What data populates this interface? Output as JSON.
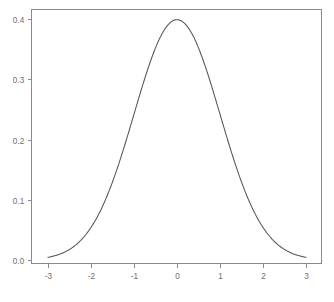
{
  "chart_data": {
    "type": "line",
    "title": "",
    "subtitle": "",
    "xlabel": "",
    "ylabel": "",
    "xlim": [
      -3,
      3
    ],
    "ylim": [
      0.0,
      0.42
    ],
    "grid": false,
    "legend": null,
    "legend_position": "none",
    "annotations": [],
    "xticks": [
      -3,
      -2,
      -1,
      0,
      1,
      2,
      3
    ],
    "xtick_labels": [
      "-3",
      "-2",
      "-1",
      "0",
      "1",
      "2",
      "3"
    ],
    "yticks": [
      0.0,
      0.1,
      0.2,
      0.3,
      0.4
    ],
    "ytick_labels": [
      "0.0",
      "0.1",
      "0.2",
      "0.3",
      "0.4"
    ],
    "series": [
      {
        "name": "standard normal density",
        "color": "#555555",
        "x": [
          -3.0,
          -2.9,
          -2.8,
          -2.7,
          -2.6,
          -2.5,
          -2.4,
          -2.3,
          -2.2,
          -2.1,
          -2.0,
          -1.9,
          -1.8,
          -1.7,
          -1.6,
          -1.5,
          -1.4,
          -1.3,
          -1.2,
          -1.1,
          -1.0,
          -0.9,
          -0.8,
          -0.7,
          -0.6,
          -0.5,
          -0.4,
          -0.3,
          -0.2,
          -0.1,
          0.0,
          0.1,
          0.2,
          0.3,
          0.4,
          0.5,
          0.6,
          0.7,
          0.8,
          0.9,
          1.0,
          1.1,
          1.2,
          1.3,
          1.4,
          1.5,
          1.6,
          1.7,
          1.8,
          1.9,
          2.0,
          2.1,
          2.2,
          2.3,
          2.4,
          2.5,
          2.6,
          2.7,
          2.8,
          2.9,
          3.0
        ],
        "y": [
          0.0044,
          0.006,
          0.0079,
          0.0104,
          0.0136,
          0.0175,
          0.0224,
          0.0283,
          0.0355,
          0.044,
          0.054,
          0.0656,
          0.079,
          0.094,
          0.1109,
          0.1295,
          0.1497,
          0.1714,
          0.1942,
          0.2179,
          0.242,
          0.2661,
          0.2897,
          0.3123,
          0.3332,
          0.3521,
          0.3683,
          0.3814,
          0.391,
          0.397,
          0.3989,
          0.397,
          0.391,
          0.3814,
          0.3683,
          0.3521,
          0.3332,
          0.3123,
          0.2897,
          0.2661,
          0.242,
          0.2179,
          0.1942,
          0.1714,
          0.1497,
          0.1295,
          0.1109,
          0.094,
          0.079,
          0.0656,
          0.054,
          0.044,
          0.0355,
          0.0283,
          0.0224,
          0.0175,
          0.0136,
          0.0104,
          0.0079,
          0.006,
          0.0044
        ]
      }
    ]
  },
  "plot": {
    "background_color": "#ffffff",
    "frame_color": "#8a8a8a",
    "tick_label_color": "#6e6e6e"
  }
}
